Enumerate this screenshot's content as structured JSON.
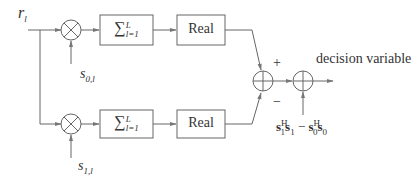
{
  "diagram": {
    "input_label": "r",
    "input_sub": "l",
    "branches": [
      {
        "name": "top",
        "mult_input_label": "s",
        "mult_input_sub": "0,l",
        "sum_block": {
          "symbol": "∑",
          "upper": "L",
          "lower": "l=1"
        },
        "real_block": "Real"
      },
      {
        "name": "bottom",
        "mult_input_label": "s",
        "mult_input_sub": "1,l",
        "sum_block": {
          "symbol": "∑",
          "upper": "L",
          "lower": "l=1"
        },
        "real_block": "Real"
      }
    ],
    "adder_signs": {
      "plus": "+",
      "minus": "−"
    },
    "bias_term": {
      "a": "s",
      "a_sup": "H",
      "a_sub": "1",
      "b": "s",
      "b_sub": "1",
      "op": "−",
      "c": "s",
      "c_sup": "H",
      "c_sub": "0",
      "d": "s",
      "d_sub": "0"
    },
    "output_label": "decision variable",
    "colors": {
      "line": "#666666",
      "text": "#333333"
    }
  }
}
